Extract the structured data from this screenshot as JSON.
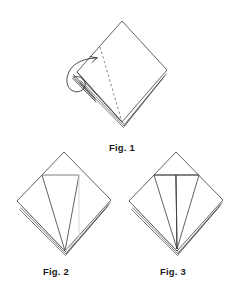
{
  "document": {
    "title": "Napkin folding instruction diagram",
    "background_color": "#ffffff",
    "line_color": "#333333",
    "faint_line_color": "#cccccc",
    "caption_color": "#1b1b1b"
  },
  "figures": [
    {
      "id": "fig1",
      "caption": "Fig. 1",
      "description": "Folded square napkin set as a diamond with stacked layer edges along the lower right, a dashed fold line from the upper left edge to the bottom point, and a curved arrow looping around the left corner.",
      "elements": {
        "outline": "diamond",
        "dashed_fold_line": true,
        "curved_arrow": true,
        "layer_edges": 4
      }
    },
    {
      "id": "fig2",
      "caption": "Fig. 2",
      "description": "Diamond napkin with the first point folded up toward the top, forming a narrow triangular flap on the left half; faint crease line visible.",
      "elements": {
        "outline": "diamond",
        "dashed_fold_line": false,
        "curved_arrow": false,
        "layer_edges": 3,
        "folded_flaps": 1
      }
    },
    {
      "id": "fig3",
      "caption": "Fig. 3",
      "description": "Diamond napkin with two points folded up, forming a symmetric pair of triangular flaps meeting at the bottom point.",
      "elements": {
        "outline": "diamond",
        "dashed_fold_line": false,
        "curved_arrow": false,
        "layer_edges": 3,
        "folded_flaps": 2
      }
    }
  ]
}
